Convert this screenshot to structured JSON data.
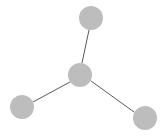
{
  "canvas": {
    "width": 168,
    "height": 140,
    "background_color": "#FFFFFF",
    "title": "Star graph diagram"
  },
  "style": {
    "node_fill_color": "#BDBDBD",
    "node_stroke_color": "#BDBDBD",
    "edge_color": "#595959",
    "edge_width": 1,
    "node_radius": 12
  },
  "chart_data": {
    "type": "scatter",
    "title": "",
    "xlabel": "",
    "ylabel": "",
    "grid": false,
    "legend": false,
    "graph_kind": "star",
    "node_count": 4,
    "edge_count": 3,
    "nodes": [
      {
        "id": "center",
        "label": "",
        "x": 80,
        "y": 75,
        "r": 12,
        "color": "#BDBDBD",
        "role": "hub"
      },
      {
        "id": "top",
        "label": "",
        "x": 91,
        "y": 18,
        "r": 12,
        "color": "#BDBDBD",
        "role": "leaf"
      },
      {
        "id": "bottom-left",
        "label": "",
        "x": 22,
        "y": 107,
        "r": 12,
        "color": "#BDBDBD",
        "role": "leaf"
      },
      {
        "id": "bottom-right",
        "label": "",
        "x": 145,
        "y": 118,
        "r": 12,
        "color": "#BDBDBD",
        "role": "leaf"
      }
    ],
    "edges": [
      {
        "id": "edge-center-top",
        "source": "center",
        "target": "top",
        "x1": 82,
        "y1": 63,
        "x2": 89,
        "y2": 30
      },
      {
        "id": "edge-center-bottom-left",
        "source": "center",
        "target": "bottom-left",
        "x1": 70,
        "y1": 82,
        "x2": 33,
        "y2": 102
      },
      {
        "id": "edge-center-bottom-right",
        "source": "center",
        "target": "bottom-right",
        "x1": 91,
        "y1": 81,
        "x2": 134,
        "y2": 112
      }
    ]
  }
}
